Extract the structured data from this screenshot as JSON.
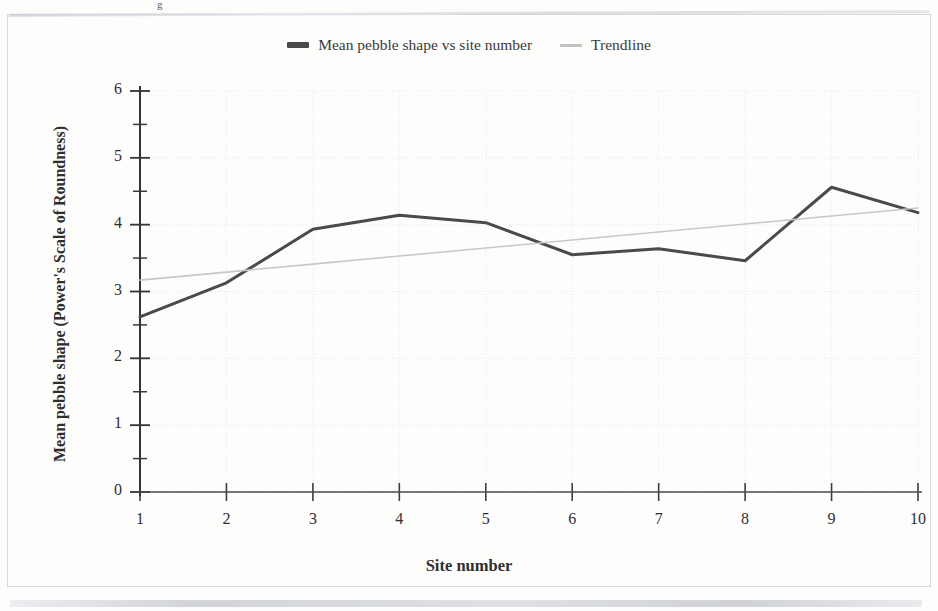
{
  "legend": {
    "entries": [
      {
        "label": "Mean pebble shape vs site number",
        "color": "#4a4a4a",
        "style": "solid-thick"
      },
      {
        "label": "Trendline",
        "color": "#c2c2c2",
        "style": "solid-thin"
      }
    ]
  },
  "axes": {
    "y_title": "Mean pebble shape (Power's Scale of Roundness)",
    "x_title": "Site number"
  },
  "artifacts": {
    "top_fragment": "g"
  },
  "chart_data": {
    "type": "line",
    "title": "",
    "subtitle": "",
    "xlabel": "Site number",
    "ylabel": "Mean pebble shape (Power's Scale of Roundness)",
    "x": [
      1,
      2,
      3,
      4,
      5,
      6,
      7,
      8,
      9,
      10
    ],
    "xlim": [
      1,
      10
    ],
    "ylim": [
      0,
      6
    ],
    "xticks": [
      1,
      2,
      3,
      4,
      5,
      6,
      7,
      8,
      9,
      10
    ],
    "yticks": [
      0,
      1,
      2,
      3,
      4,
      5,
      6
    ],
    "y_minor_ticks": [
      0.5,
      1.5,
      2.5,
      3.5,
      4.5,
      5.5
    ],
    "grid": true,
    "grid_color": "#e8e8ee",
    "legend_position": "top-center",
    "series": [
      {
        "name": "Mean pebble shape vs site number",
        "color": "#4a4a4a",
        "width": 3,
        "values": [
          2.62,
          3.13,
          3.93,
          4.14,
          4.03,
          3.55,
          3.64,
          3.46,
          4.56,
          4.18
        ]
      },
      {
        "name": "Trendline",
        "color": "#c8c8c8",
        "width": 1.6,
        "values": [
          3.17,
          3.29,
          3.41,
          3.53,
          3.65,
          3.77,
          3.89,
          4.01,
          4.13,
          4.25
        ]
      }
    ]
  }
}
